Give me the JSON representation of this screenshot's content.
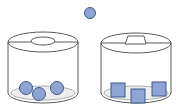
{
  "diagram": {
    "colors": {
      "background": "#ffffff",
      "outline": "#5a5a5a",
      "shape_fill": "#8ea4d4",
      "shape_stroke": "#3c5a8c",
      "container_fill": "#ffffff",
      "floor_fill": "#eeeeee"
    },
    "floating_shape": {
      "type": "circle",
      "cx": 90,
      "cy": 13,
      "r": 5.5
    },
    "containers": [
      {
        "id": "left",
        "hole_shape": "circle",
        "body": {
          "cx": 43,
          "rx": 35,
          "top_cy": 42,
          "bottom_cy": 93,
          "ry": 10
        },
        "hole": {
          "type": "ellipse",
          "cx": 43,
          "cy": 41,
          "rx": 12,
          "ry": 4
        },
        "contents": [
          {
            "type": "circle",
            "cx": 26,
            "cy": 88,
            "r": 6.5
          },
          {
            "type": "circle",
            "cx": 39,
            "cy": 94,
            "r": 6.5
          },
          {
            "type": "circle",
            "cx": 57,
            "cy": 88,
            "r": 6.5
          }
        ]
      },
      {
        "id": "right",
        "hole_shape": "trapezoid",
        "body": {
          "cx": 136,
          "rx": 35,
          "top_cy": 43,
          "bottom_cy": 93,
          "ry": 10
        },
        "hole": {
          "type": "trapezoid",
          "points": "128,36 144,36 146,44 125,44"
        },
        "contents": [
          {
            "type": "square",
            "x": 111,
            "y": 83,
            "size": 14
          },
          {
            "type": "square",
            "x": 131,
            "y": 89,
            "size": 14
          },
          {
            "type": "square",
            "x": 152,
            "y": 82,
            "size": 14
          }
        ]
      }
    ]
  }
}
